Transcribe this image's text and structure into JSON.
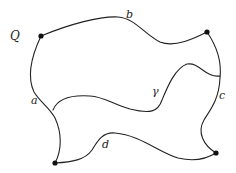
{
  "diagram": {
    "labels": {
      "Q": "Q",
      "a": "a",
      "b": "b",
      "c": "c",
      "d": "d",
      "gamma": "γ"
    },
    "vertices": [
      {
        "name": "Q",
        "x": 41,
        "y": 36
      },
      {
        "name": "top-right",
        "x": 207,
        "y": 32
      },
      {
        "name": "bottom-left",
        "x": 55,
        "y": 163
      },
      {
        "name": "bottom-right",
        "x": 216,
        "y": 153
      }
    ],
    "colors": {
      "stroke": "#222222",
      "vertex": "#111111",
      "background": "#ffffff"
    }
  }
}
